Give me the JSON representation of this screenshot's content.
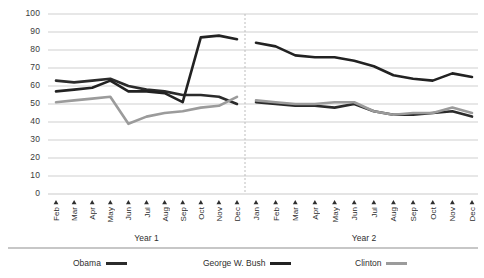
{
  "chart_data": {
    "type": "line",
    "title": "",
    "subtitle": "",
    "xlabel": "",
    "ylabel": "",
    "ylim": [
      0,
      100
    ],
    "yticks": [
      0,
      10,
      20,
      30,
      40,
      50,
      60,
      70,
      80,
      90,
      100
    ],
    "grid": true,
    "legend_position": "bottom",
    "panels": [
      {
        "name": "Year 1",
        "label": "Year 1",
        "categories": [
          "Feb",
          "Mar",
          "Apr",
          "May",
          "Jun",
          "Jul",
          "Aug",
          "Sep",
          "Oct",
          "Nov",
          "Dec"
        ]
      },
      {
        "name": "Year 2",
        "label": "Year 2",
        "categories": [
          "Jan",
          "Feb",
          "Mar",
          "Apr",
          "May",
          "Jun",
          "Jul",
          "Aug",
          "Sep",
          "Oct",
          "Nov",
          "Dec"
        ]
      }
    ],
    "series": [
      {
        "name": "Obama",
        "color": "#2b2b2b",
        "width": 2.6,
        "year1": [
          63,
          62,
          63,
          64,
          60,
          58,
          57,
          55,
          55,
          54,
          50
        ],
        "year2": [
          51,
          50,
          49,
          49,
          48,
          50,
          46,
          44,
          44,
          45,
          46,
          43
        ]
      },
      {
        "name": "George W. Bush",
        "color": "#222222",
        "width": 2.6,
        "year1": [
          57,
          58,
          59,
          63,
          57,
          57,
          56,
          51,
          87,
          88,
          86
        ],
        "year2": [
          84,
          82,
          77,
          76,
          76,
          74,
          71,
          66,
          64,
          63,
          67,
          65
        ]
      },
      {
        "name": "Clinton",
        "color": "#9b9b9b",
        "width": 2.6,
        "year1": [
          51,
          52,
          53,
          54,
          39,
          43,
          45,
          46,
          48,
          49,
          54
        ],
        "year2": [
          52,
          51,
          50,
          50,
          51,
          51,
          46,
          44,
          45,
          45,
          48,
          45
        ]
      }
    ]
  },
  "axis": {
    "y_labels": [
      "100",
      "90",
      "80",
      "70",
      "60",
      "50",
      "40",
      "30",
      "20",
      "10",
      "0"
    ]
  },
  "legend": {
    "items": [
      {
        "label": "Obama",
        "color": "#2b2b2b",
        "style": "thick"
      },
      {
        "label": "George W. Bush",
        "color": "#222222",
        "style": "thick"
      },
      {
        "label": "Clinton",
        "color": "#9b9b9b",
        "style": "thick"
      }
    ]
  }
}
